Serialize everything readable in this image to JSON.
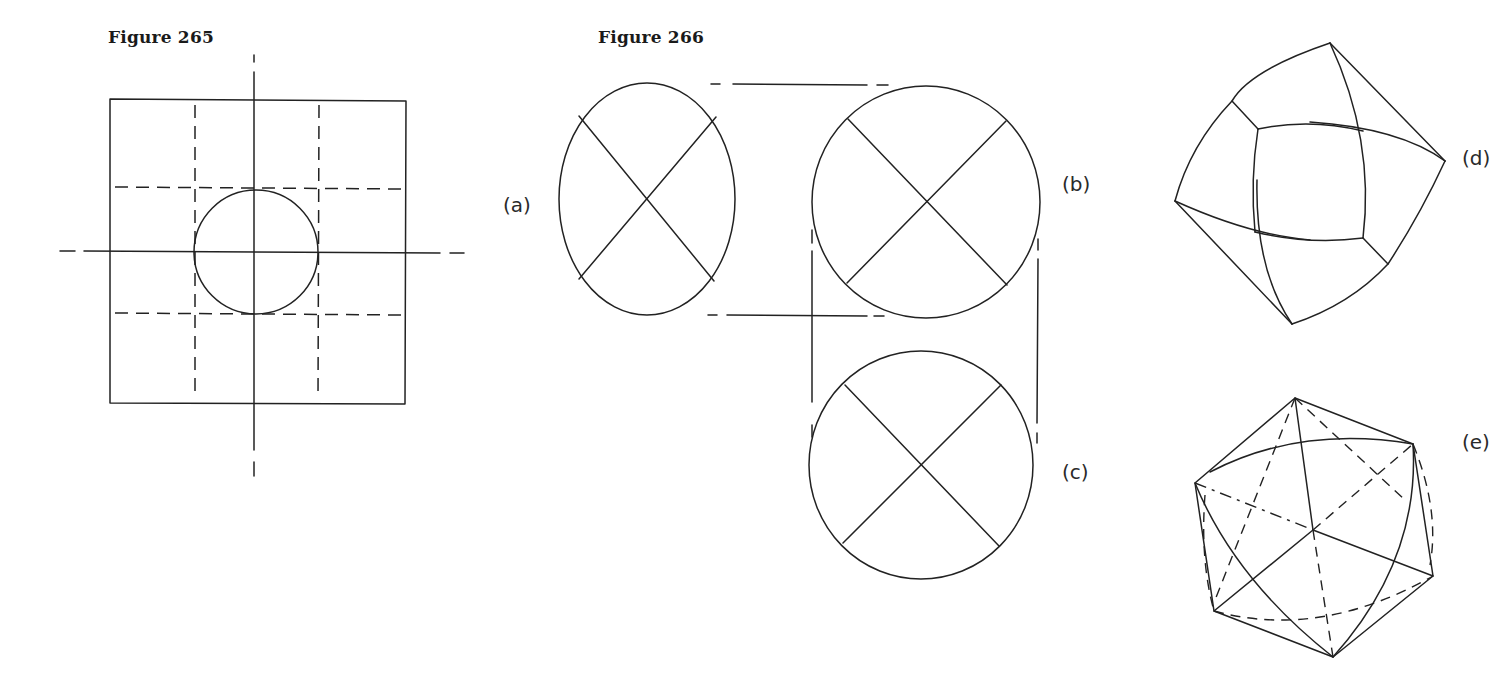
{
  "figures": [
    {
      "id": "fig265",
      "title": "Figure 265",
      "description": "Square plate with central circular hole, center lines and dashed hidden lines"
    },
    {
      "id": "fig266",
      "title": "Figure 266",
      "views": [
        {
          "label": "(a)",
          "kind": "circle-with-diagonal-cross"
        },
        {
          "label": "(b)",
          "kind": "circle-with-diagonal-cross"
        },
        {
          "label": "(c)",
          "kind": "circle-with-diagonal-cross"
        },
        {
          "label": "(d)",
          "kind": "curved-solid-pictorial"
        },
        {
          "label": "(e)",
          "kind": "polyhedron-pictorial-with-hidden-edges"
        }
      ]
    }
  ],
  "colors": {
    "ink": "#222222",
    "paper": "#ffffff"
  }
}
